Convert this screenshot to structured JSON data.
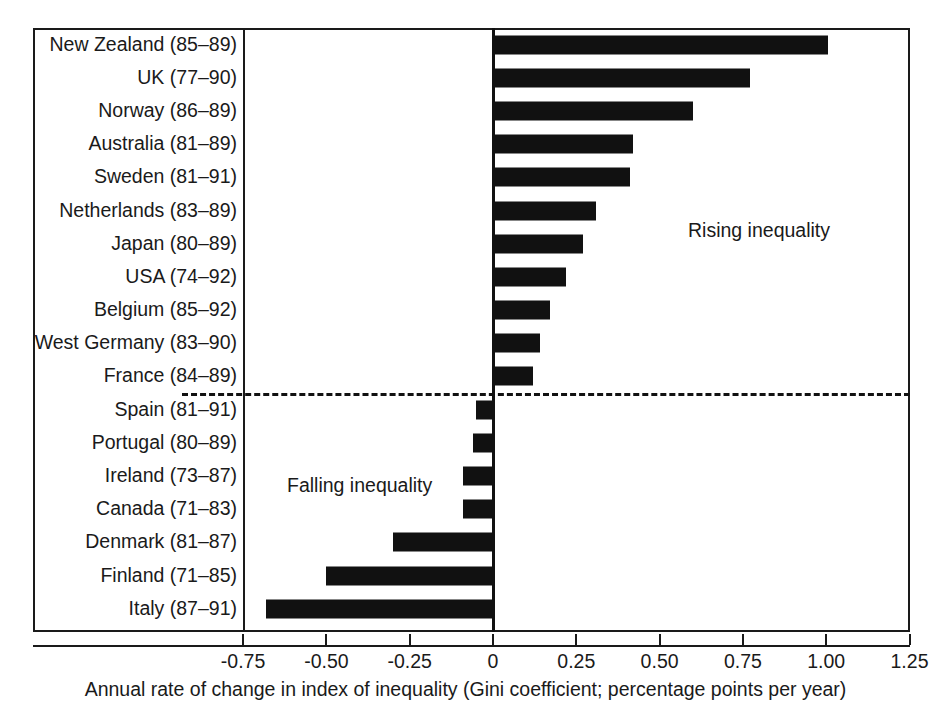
{
  "chart_data": {
    "type": "bar",
    "orientation": "horizontal",
    "title": "",
    "xlabel": "Annual rate of change in index of inequality (Gini coefficient; percentage points per year)",
    "ylabel": "",
    "xlim": [
      -0.75,
      1.25
    ],
    "xticks": [
      "-0.75",
      "-0.50",
      "-0.25",
      "0",
      "0.25",
      "0.50",
      "0.75",
      "1.00",
      "1.25"
    ],
    "xtick_values": [
      -0.75,
      -0.5,
      -0.25,
      0,
      0.25,
      0.5,
      0.75,
      1.0,
      1.25
    ],
    "grid": false,
    "legend": "none",
    "bar_color": "#111111",
    "categories": [
      "New Zealand (85–89)",
      "UK (77–90)",
      "Norway (86–89)",
      "Australia (81–89)",
      "Sweden (81–91)",
      "Netherlands (83–89)",
      "Japan (80–89)",
      "USA (74–92)",
      "Belgium (85–92)",
      "West Germany (83–90)",
      "France (84–89)",
      "Spain (81–91)",
      "Portugal (80–89)",
      "Ireland (73–87)",
      "Canada (71–83)",
      "Denmark (81–87)",
      "Finland (71–85)",
      "Italy (87–91)"
    ],
    "values": [
      1.005,
      0.77,
      0.6,
      0.42,
      0.41,
      0.31,
      0.27,
      0.22,
      0.17,
      0.14,
      0.12,
      -0.05,
      -0.06,
      -0.09,
      -0.09,
      -0.3,
      -0.5,
      -0.68
    ],
    "annotations": [
      {
        "text": "Rising inequality",
        "x": 0.59,
        "y_category": "Netherlands (83–89)"
      },
      {
        "text": "Falling inequality",
        "x": -0.62,
        "y_category": "Ireland (73–87)"
      }
    ],
    "divider": {
      "style": "dashed",
      "between": [
        "France (84–89)",
        "Spain (81–91)"
      ]
    }
  }
}
